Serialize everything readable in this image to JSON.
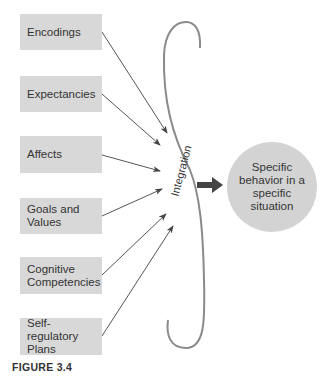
{
  "inputs": [
    {
      "label": "Encodings"
    },
    {
      "label": "Expectancies"
    },
    {
      "label": "Affects"
    },
    {
      "label": "Goals and Values"
    },
    {
      "label": "Cognitive Competencies"
    },
    {
      "label": "Self-regulatory Plans"
    }
  ],
  "integration_label": "Integration",
  "output": {
    "label": "Specific behavior in a specific situation"
  },
  "figure_label": "FIGURE 3.4",
  "colors": {
    "box": "#d8d8d8",
    "circle": "#d3d3d3",
    "arrow": "#555555",
    "brace": "#8a8a8a",
    "thick_arrow": "#444444"
  }
}
